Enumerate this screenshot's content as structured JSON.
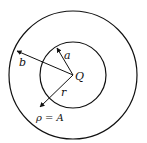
{
  "diagram": {
    "title": "",
    "labels": {
      "outer_radius": "b",
      "inner_radius": "a",
      "charge": "Q",
      "distance": "r",
      "charge_density": "ρ = A"
    },
    "shapes": {
      "outer_circle": {
        "cx": 73,
        "cy": 75,
        "r": 64
      },
      "inner_circle": {
        "cx": 73,
        "cy": 75,
        "r": 33
      }
    },
    "colors": {
      "stroke": "#111111",
      "background": "#ffffff"
    }
  }
}
